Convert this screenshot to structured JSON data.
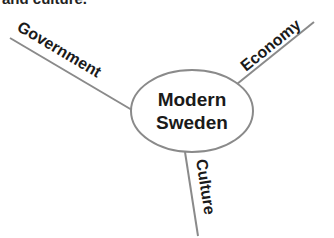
{
  "top_text_partial": "and culture.",
  "diagram": {
    "center": {
      "line1": "Modern",
      "line2": "Sweden"
    },
    "branches": [
      {
        "label": "Government"
      },
      {
        "label": "Economy"
      },
      {
        "label": "Culture"
      }
    ],
    "colors": {
      "line": "#8a8a8a",
      "text": "#1a1a1a",
      "background": "#ffffff"
    }
  }
}
